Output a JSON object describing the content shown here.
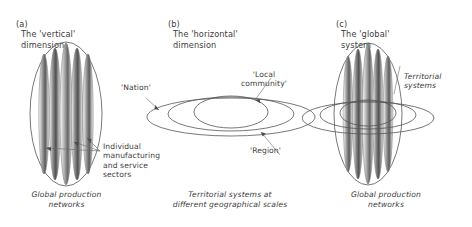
{
  "figure": {
    "background": "#ffffff",
    "stroke": "#4a4a4a",
    "text_color": "#3d3d3d"
  },
  "panels": [
    {
      "id": "a",
      "marker": "(a)",
      "title": "The 'vertical'\ndimension",
      "caption": "Global production\nnetworks",
      "annotations": [
        {
          "name": "individual-sectors-label",
          "text": "Individual\nmanufacturing\nand service\nsectors"
        }
      ]
    },
    {
      "id": "b",
      "marker": "(b)",
      "title": "The 'horizontal'\ndimension",
      "caption": "Territorial systems at\ndifferent geographical scales",
      "annotations": [
        {
          "name": "nation-label",
          "text": "'Nation'"
        },
        {
          "name": "local-community-label",
          "text": "'Local\ncommunity'"
        },
        {
          "name": "region-label",
          "text": "'Region'"
        }
      ]
    },
    {
      "id": "c",
      "marker": "(c)",
      "title": "The 'global'\nsystem",
      "caption": "Global production\nnetworks",
      "annotations": [
        {
          "name": "territorial-systems-label",
          "text": "Territorial\nsystems"
        }
      ]
    }
  ]
}
